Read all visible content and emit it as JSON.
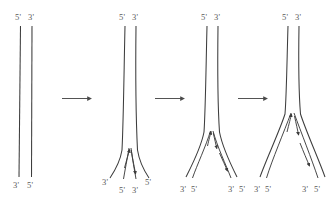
{
  "figure": {
    "background_color": "#ffffff",
    "strand_color": "#3d3d3d",
    "label_color": "#5a5a5a",
    "arrow_color": "#4a4a4a",
    "primes": {
      "five": "5'",
      "three": "3'"
    },
    "transition_arrow_label": "",
    "panels": [
      {
        "id": "panel-1",
        "stage_name": "duplex-unreplicated",
        "top_labels": [
          "5'",
          "3'"
        ],
        "bottom_labels": [
          "3'",
          "5'"
        ],
        "internal_arrows": 0
      },
      {
        "id": "panel-2",
        "stage_name": "fork-initiation",
        "top_labels": [
          "5'",
          "3'"
        ],
        "bottom_labels": [
          "3'",
          "5'",
          "3'",
          "5'"
        ],
        "internal_arrows": 2
      },
      {
        "id": "panel-3",
        "stage_name": "fork-elongation",
        "top_labels": [
          "5'",
          "3'"
        ],
        "bottom_labels": [
          "3'",
          "5'",
          "3'",
          "5'"
        ],
        "internal_arrows": 3
      },
      {
        "id": "panel-4",
        "stage_name": "fork-advanced",
        "top_labels": [
          "5'",
          "3'"
        ],
        "bottom_labels": [
          "3'",
          "5'",
          "3'",
          "5'"
        ],
        "internal_arrows": 3
      }
    ],
    "transition_arrows": [
      {
        "id": "transition-arrow-1",
        "from": "panel-1",
        "to": "panel-2"
      },
      {
        "id": "transition-arrow-2",
        "from": "panel-2",
        "to": "panel-3"
      },
      {
        "id": "transition-arrow-3",
        "from": "panel-3",
        "to": "panel-4"
      }
    ]
  }
}
